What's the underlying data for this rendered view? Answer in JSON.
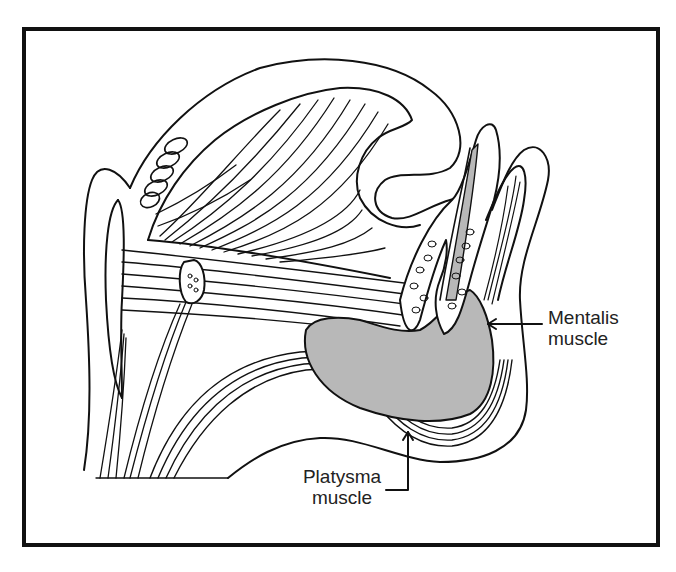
{
  "figure": {
    "colors": {
      "frame": "#111111",
      "line": "#111111",
      "shaded_region": "#b8b8b8",
      "background": "#ffffff"
    }
  },
  "labels": {
    "mentalis": {
      "line1": "Mentalis",
      "line2": "muscle"
    },
    "platysma": {
      "line1": "Platysma",
      "line2": "muscle"
    }
  }
}
